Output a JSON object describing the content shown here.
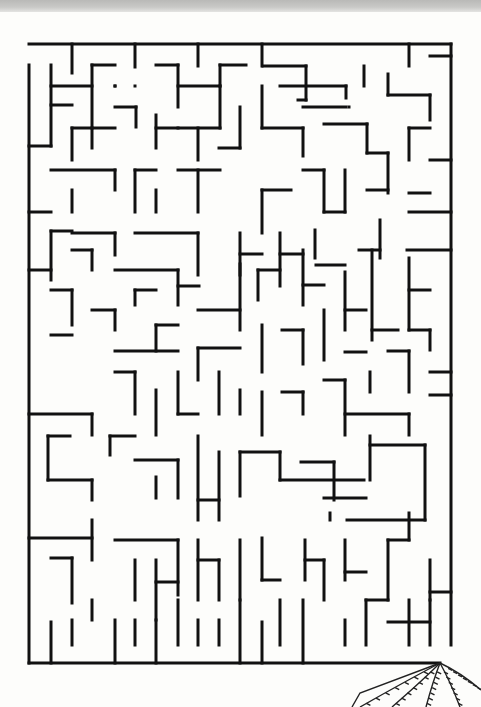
{
  "page": {
    "top_strip_color": "#c4c4c2",
    "paper_color": "#fdfdfb",
    "ink_color": "#111111"
  },
  "maze": {
    "bounds": {
      "left": 29,
      "top": 44,
      "right": 451,
      "bottom": 663
    },
    "cell_size": 21,
    "entrance": "top-left gap in left wall (y 44-65)",
    "exit": "bottom-right gap in bottom wall (x 440-451)",
    "walls": [
      [
        29,
        44,
        451,
        44
      ],
      [
        451,
        44,
        451,
        645
      ],
      [
        29,
        65,
        29,
        663
      ],
      [
        29,
        663,
        440,
        663
      ],
      [
        72,
        44,
        72,
        73
      ],
      [
        135,
        44,
        135,
        67
      ],
      [
        198,
        44,
        198,
        66
      ],
      [
        262,
        44,
        262,
        66
      ],
      [
        409,
        44,
        409,
        66
      ],
      [
        51,
        65,
        51,
        146
      ],
      [
        51,
        86,
        92,
        86
      ],
      [
        51,
        105,
        72,
        105
      ],
      [
        92,
        65,
        92,
        148
      ],
      [
        92,
        65,
        115,
        65
      ],
      [
        29,
        146,
        51,
        146
      ],
      [
        156,
        65,
        178,
        65
      ],
      [
        178,
        65,
        178,
        107
      ],
      [
        178,
        86,
        220,
        86
      ],
      [
        220,
        86,
        220,
        65
      ],
      [
        220,
        65,
        246,
        65
      ],
      [
        115,
        86,
        115,
        86
      ],
      [
        115,
        86,
        115,
        86
      ],
      [
        135,
        86,
        135,
        86
      ],
      [
        263,
        66,
        306,
        66
      ],
      [
        306,
        66,
        306,
        100
      ],
      [
        306,
        100,
        298,
        100
      ],
      [
        364,
        66,
        364,
        86
      ],
      [
        388,
        74,
        388,
        95
      ],
      [
        388,
        95,
        430,
        95
      ],
      [
        430,
        95,
        430,
        120
      ],
      [
        280,
        86,
        346,
        86
      ],
      [
        346,
        86,
        346,
        98
      ],
      [
        303,
        107,
        346,
        107
      ],
      [
        349,
        107,
        349,
        107
      ],
      [
        430,
        56,
        451,
        56
      ],
      [
        72,
        128,
        92,
        128
      ],
      [
        72,
        128,
        72,
        160
      ],
      [
        115,
        107,
        136,
        107
      ],
      [
        136,
        107,
        136,
        127
      ],
      [
        92,
        128,
        115,
        128
      ],
      [
        156,
        115,
        156,
        148
      ],
      [
        156,
        128,
        178,
        128
      ],
      [
        198,
        128,
        198,
        160
      ],
      [
        178,
        128,
        220,
        128
      ],
      [
        220,
        86,
        220,
        128
      ],
      [
        240,
        107,
        240,
        148
      ],
      [
        240,
        148,
        219,
        148
      ],
      [
        262,
        86,
        262,
        128
      ],
      [
        262,
        128,
        303,
        128
      ],
      [
        303,
        128,
        303,
        156
      ],
      [
        324,
        124,
        367,
        124
      ],
      [
        367,
        124,
        367,
        153
      ],
      [
        367,
        153,
        388,
        153
      ],
      [
        388,
        153,
        388,
        193
      ],
      [
        409,
        128,
        409,
        160
      ],
      [
        409,
        128,
        430,
        128
      ],
      [
        430,
        160,
        451,
        160
      ],
      [
        51,
        170,
        115,
        170
      ],
      [
        115,
        170,
        115,
        190
      ],
      [
        72,
        190,
        72,
        212
      ],
      [
        135,
        170,
        135,
        212
      ],
      [
        135,
        170,
        156,
        170
      ],
      [
        156,
        190,
        156,
        212
      ],
      [
        178,
        170,
        220,
        170
      ],
      [
        198,
        170,
        198,
        212
      ],
      [
        262,
        190,
        262,
        233
      ],
      [
        262,
        190,
        291,
        190
      ],
      [
        303,
        170,
        324,
        170
      ],
      [
        324,
        170,
        324,
        212
      ],
      [
        324,
        212,
        345,
        212
      ],
      [
        345,
        170,
        345,
        212
      ],
      [
        367,
        190,
        388,
        190
      ],
      [
        409,
        193,
        430,
        193
      ],
      [
        409,
        212,
        451,
        212
      ],
      [
        29,
        212,
        51,
        212
      ],
      [
        72,
        233,
        115,
        233
      ],
      [
        115,
        233,
        115,
        255
      ],
      [
        135,
        233,
        198,
        233
      ],
      [
        198,
        233,
        198,
        275
      ],
      [
        240,
        233,
        240,
        275
      ],
      [
        240,
        254,
        262,
        254
      ],
      [
        280,
        233,
        280,
        286
      ],
      [
        280,
        254,
        303,
        254
      ],
      [
        315,
        230,
        315,
        258
      ],
      [
        316,
        265,
        345,
        265
      ],
      [
        359,
        250,
        380,
        250
      ],
      [
        380,
        220,
        380,
        258
      ],
      [
        407,
        250,
        451,
        250
      ],
      [
        51,
        231,
        51,
        280
      ],
      [
        51,
        231,
        72,
        231
      ],
      [
        72,
        250,
        92,
        250
      ],
      [
        92,
        250,
        92,
        270
      ],
      [
        115,
        270,
        178,
        270
      ],
      [
        178,
        270,
        178,
        305
      ],
      [
        178,
        286,
        199,
        286
      ],
      [
        135,
        290,
        135,
        305
      ],
      [
        135,
        290,
        156,
        290
      ],
      [
        198,
        310,
        240,
        310
      ],
      [
        240,
        264,
        240,
        330
      ],
      [
        258,
        270,
        280,
        270
      ],
      [
        258,
        270,
        258,
        300
      ],
      [
        303,
        250,
        303,
        305
      ],
      [
        303,
        285,
        324,
        285
      ],
      [
        324,
        310,
        324,
        360
      ],
      [
        345,
        272,
        345,
        330
      ],
      [
        345,
        310,
        366,
        310
      ],
      [
        372,
        250,
        372,
        340
      ],
      [
        372,
        330,
        398,
        330
      ],
      [
        409,
        258,
        409,
        330
      ],
      [
        409,
        330,
        430,
        330
      ],
      [
        430,
        330,
        430,
        350
      ],
      [
        409,
        290,
        430,
        290
      ],
      [
        29,
        270,
        51,
        270
      ],
      [
        51,
        290,
        72,
        290
      ],
      [
        72,
        290,
        72,
        325
      ],
      [
        92,
        310,
        115,
        310
      ],
      [
        115,
        310,
        115,
        330
      ],
      [
        51,
        335,
        72,
        335
      ],
      [
        156,
        325,
        178,
        325
      ],
      [
        156,
        325,
        156,
        351
      ],
      [
        115,
        351,
        178,
        351
      ],
      [
        198,
        348,
        240,
        348
      ],
      [
        198,
        348,
        198,
        380
      ],
      [
        262,
        325,
        262,
        372
      ],
      [
        282,
        330,
        303,
        330
      ],
      [
        303,
        330,
        303,
        364
      ],
      [
        345,
        352,
        366,
        352
      ],
      [
        388,
        351,
        409,
        351
      ],
      [
        409,
        351,
        409,
        392
      ],
      [
        430,
        372,
        451,
        372
      ],
      [
        29,
        414,
        92,
        414
      ],
      [
        92,
        414,
        92,
        435
      ],
      [
        115,
        372,
        135,
        372
      ],
      [
        135,
        372,
        135,
        414
      ],
      [
        156,
        390,
        156,
        435
      ],
      [
        178,
        372,
        178,
        414
      ],
      [
        178,
        414,
        198,
        414
      ],
      [
        219,
        372,
        219,
        414
      ],
      [
        240,
        390,
        240,
        414
      ],
      [
        262,
        392,
        262,
        435
      ],
      [
        282,
        392,
        303,
        392
      ],
      [
        303,
        392,
        303,
        414
      ],
      [
        324,
        380,
        345,
        380
      ],
      [
        345,
        380,
        345,
        435
      ],
      [
        345,
        414,
        409,
        414
      ],
      [
        409,
        414,
        409,
        435
      ],
      [
        370,
        372,
        370,
        392
      ],
      [
        430,
        395,
        451,
        395
      ],
      [
        48,
        436,
        70,
        436
      ],
      [
        48,
        436,
        48,
        480
      ],
      [
        48,
        480,
        92,
        480
      ],
      [
        92,
        480,
        92,
        500
      ],
      [
        110,
        436,
        135,
        436
      ],
      [
        110,
        436,
        110,
        455
      ],
      [
        135,
        460,
        178,
        460
      ],
      [
        178,
        460,
        178,
        498
      ],
      [
        156,
        477,
        156,
        498
      ],
      [
        198,
        436,
        198,
        520
      ],
      [
        198,
        500,
        219,
        500
      ],
      [
        219,
        452,
        219,
        520
      ],
      [
        240,
        452,
        240,
        496
      ],
      [
        240,
        452,
        280,
        452
      ],
      [
        280,
        452,
        280,
        480
      ],
      [
        280,
        480,
        364,
        480
      ],
      [
        301,
        462,
        334,
        462
      ],
      [
        334,
        462,
        334,
        500
      ],
      [
        324,
        498,
        366,
        498
      ],
      [
        370,
        436,
        370,
        480
      ],
      [
        370,
        445,
        425,
        445
      ],
      [
        425,
        445,
        425,
        520
      ],
      [
        425,
        520,
        347,
        520
      ],
      [
        330,
        513,
        330,
        520
      ],
      [
        409,
        513,
        409,
        540
      ],
      [
        29,
        538,
        92,
        538
      ],
      [
        51,
        558,
        72,
        558
      ],
      [
        72,
        558,
        72,
        603
      ],
      [
        92,
        520,
        92,
        560
      ],
      [
        115,
        540,
        178,
        540
      ],
      [
        178,
        540,
        178,
        595
      ],
      [
        135,
        560,
        135,
        600
      ],
      [
        156,
        560,
        156,
        620
      ],
      [
        156,
        582,
        178,
        582
      ],
      [
        198,
        540,
        198,
        600
      ],
      [
        198,
        560,
        219,
        560
      ],
      [
        219,
        560,
        219,
        600
      ],
      [
        240,
        540,
        240,
        600
      ],
      [
        262,
        538,
        262,
        580
      ],
      [
        262,
        580,
        280,
        580
      ],
      [
        305,
        540,
        305,
        580
      ],
      [
        305,
        560,
        324,
        560
      ],
      [
        324,
        560,
        324,
        600
      ],
      [
        345,
        540,
        345,
        580
      ],
      [
        345,
        572,
        366,
        572
      ],
      [
        388,
        540,
        388,
        600
      ],
      [
        388,
        540,
        409,
        540
      ],
      [
        430,
        560,
        430,
        600
      ],
      [
        430,
        592,
        451,
        592
      ],
      [
        51,
        622,
        51,
        663
      ],
      [
        72,
        620,
        72,
        645
      ],
      [
        92,
        600,
        92,
        620
      ],
      [
        115,
        620,
        115,
        663
      ],
      [
        135,
        620,
        135,
        645
      ],
      [
        156,
        620,
        156,
        663
      ],
      [
        178,
        600,
        178,
        645
      ],
      [
        198,
        620,
        198,
        645
      ],
      [
        219,
        620,
        219,
        645
      ],
      [
        240,
        600,
        240,
        663
      ],
      [
        262,
        622,
        262,
        663
      ],
      [
        280,
        600,
        280,
        645
      ],
      [
        303,
        600,
        303,
        663
      ],
      [
        345,
        620,
        345,
        645
      ],
      [
        366,
        600,
        366,
        645
      ],
      [
        366,
        600,
        388,
        600
      ],
      [
        409,
        600,
        409,
        645
      ],
      [
        388,
        622,
        430,
        622
      ],
      [
        430,
        600,
        430,
        645
      ]
    ]
  },
  "decoration": {
    "name": "fan-drawing",
    "apex": [
      440,
      663
    ],
    "rays": [
      [
        360,
        707
      ],
      [
        392,
        707
      ],
      [
        426,
        707
      ],
      [
        460,
        707
      ],
      [
        481,
        690
      ]
    ]
  }
}
